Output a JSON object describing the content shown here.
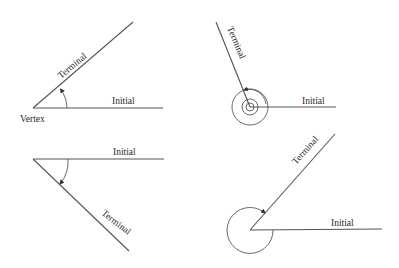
{
  "diagram": {
    "colors": {
      "line": "#555555",
      "text": "#2a2a2a",
      "background": "#ffffff"
    },
    "panels": [
      {
        "id": "positive-acute",
        "labels": {
          "initial": "Initial",
          "terminal": "Terminal",
          "vertex": "Vertex"
        },
        "rotation": "counterclockwise",
        "vertex": [
          33,
          108
        ]
      },
      {
        "id": "positive-multi-rotation",
        "labels": {
          "initial": "Initial",
          "terminal": "Terminal"
        },
        "rotation": "counterclockwise, more than one full revolution",
        "vertex": [
          250,
          107
        ]
      },
      {
        "id": "negative-acute",
        "labels": {
          "initial": "Initial",
          "terminal": "Terminal"
        },
        "rotation": "clockwise",
        "vertex": [
          33,
          159
        ]
      },
      {
        "id": "negative-reflex",
        "labels": {
          "initial": "Initial",
          "terminal": "Terminal"
        },
        "rotation": "clockwise, reflex angle",
        "vertex": [
          250,
          230
        ]
      }
    ]
  }
}
